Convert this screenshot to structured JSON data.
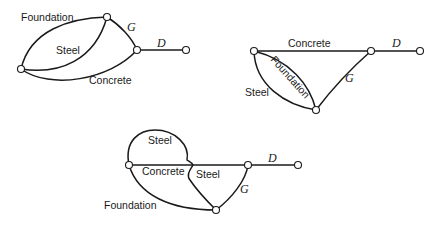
{
  "diagrams": [
    {
      "id": "network-1",
      "labels": {
        "foundation": "Foundation",
        "steel": "Steel",
        "concrete": "Concrete",
        "g": "G",
        "d": "D"
      }
    },
    {
      "id": "network-2",
      "labels": {
        "concrete": "Concrete",
        "foundation": "Foundation",
        "steel": "Steel",
        "g": "G",
        "d": "D"
      }
    },
    {
      "id": "network-3",
      "labels": {
        "steel_top": "Steel",
        "concrete": "Concrete",
        "steel_cross": "Steel",
        "foundation": "Foundation",
        "g": "G",
        "d": "D"
      }
    }
  ]
}
